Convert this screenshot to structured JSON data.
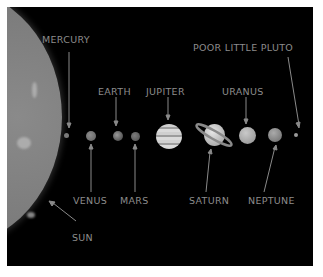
{
  "diagram": {
    "type": "labeled-illustration",
    "background_color": "#000000",
    "label_color": "#8c8c8c",
    "labels": {
      "sun": "SUN",
      "mercury": "MERCURY",
      "venus": "VENUS",
      "earth": "EARTH",
      "mars": "MARS",
      "jupiter": "JUPITER",
      "saturn": "SATURN",
      "uranus": "URANUS",
      "neptune": "NEPTUNE",
      "pluto": "POOR LITTLE PLUTO"
    },
    "bodies_order": [
      "Sun",
      "Mercury",
      "Venus",
      "Earth",
      "Mars",
      "Jupiter",
      "Saturn",
      "Uranus",
      "Neptune",
      "Pluto"
    ],
    "label_positions": {
      "above": [
        "MERCURY",
        "EARTH",
        "JUPITER",
        "URANUS",
        "POOR LITTLE PLUTO"
      ],
      "below": [
        "VENUS",
        "MARS",
        "SATURN",
        "NEPTUNE",
        "SUN"
      ]
    }
  }
}
